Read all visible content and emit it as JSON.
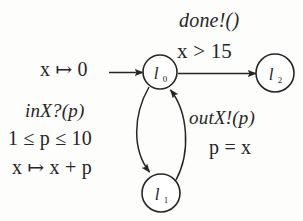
{
  "diagram": {
    "kind": "timed-automaton",
    "background_color": "#fdfdfc",
    "ink_color": "#262626",
    "nodes": [
      {
        "id": "l0",
        "label": "l",
        "subscript": "0",
        "cx": 160,
        "cy": 72,
        "r": 17
      },
      {
        "id": "l2",
        "label": "l",
        "subscript": "2",
        "cx": 275,
        "cy": 73,
        "r": 19
      },
      {
        "id": "l1",
        "label": "l",
        "subscript": "1",
        "cx": 161,
        "cy": 193,
        "r": 19
      }
    ],
    "edges": [
      {
        "id": "init",
        "from": "",
        "to": "l0",
        "shape": "straight-arrow"
      },
      {
        "id": "l0-to-l2",
        "from": "l0",
        "to": "l2",
        "shape": "straight-arrow"
      },
      {
        "id": "l0-to-l1",
        "from": "l0",
        "to": "l1",
        "shape": "curved-arrow-left"
      },
      {
        "id": "l1-to-l0",
        "from": "l1",
        "to": "l0",
        "shape": "curved-arrow-right"
      }
    ]
  },
  "labels": {
    "done_action": "done!()",
    "guard_x_gt_15": "x > 15",
    "init_assign": "x ↦ 0",
    "in_action": "inX?(p)",
    "p_range": "1 ≤ p ≤ 10",
    "x_update": "x ↦ x + p",
    "out_action": "outX!(p)",
    "p_equals_x": "p = x"
  },
  "node_labels": {
    "l0_base": "l",
    "l0_sub": "0",
    "l1_base": "l",
    "l1_sub": "1",
    "l2_base": "l",
    "l2_sub": "2"
  }
}
